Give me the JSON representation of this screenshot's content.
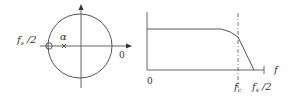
{
  "figure": {
    "left_panel": {
      "type": "z-plane unit circle",
      "labels": {
        "fs_half_main": "f",
        "fs_half_sub": "s",
        "fs_half_tail": " /2",
        "alpha": "α",
        "zero": "0"
      },
      "markers": [
        {
          "kind": "pole-circle",
          "position": "at unit circle, real axis negative side"
        },
        {
          "kind": "zero-cross",
          "position": "alpha on real axis"
        }
      ]
    },
    "right_panel": {
      "type": "frequency response (lowpass)",
      "labels": {
        "origin": "0",
        "fc_main": "f",
        "fc_sub": "c",
        "fs_half_main": "f",
        "fs_half_sub": "s",
        "fs_half_tail": " /2",
        "axis_f": "f"
      }
    },
    "colors": {
      "stroke": "#555555",
      "text": "#333333"
    }
  }
}
